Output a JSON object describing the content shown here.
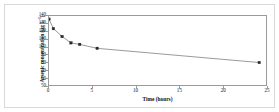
{
  "chart_data": {
    "type": "line",
    "title": "",
    "subtitle": "",
    "xlabel": "Time (hours)",
    "ylabel_main": "Arsenic concentration (µg L",
    "ylabel_sup": "-1",
    "ylabel_close": ")",
    "ylabel_full": "Arsenic concentration (µg L-1)",
    "xlim": [
      0,
      25
    ],
    "ylim": [
      50,
      140
    ],
    "xticks": [
      0,
      5,
      10,
      15,
      20,
      25
    ],
    "xtick_labels": [
      "0",
      "5",
      "10",
      "15",
      "20",
      "25"
    ],
    "yticks": [
      50,
      60,
      70,
      80,
      90,
      100,
      110,
      120,
      130,
      140
    ],
    "ytick_labels": [
      "50",
      "60",
      "70",
      "80",
      "90",
      "100",
      "110",
      "120",
      "130",
      "140"
    ],
    "grid": false,
    "legend": null,
    "legend_position": "none",
    "marker_style": "filled-square",
    "line_color": "#6e6e6e",
    "marker_color": "#2b2b2b",
    "axis_color": "#9a9a9a",
    "frame_color": "#d8d8d8",
    "background_color": "#ffffff",
    "series": [
      {
        "name": "Arsenic concentration",
        "x": [
          0,
          0.5,
          1.5,
          2.5,
          3.5,
          5.5,
          24
        ],
        "values": [
          136,
          124,
          114,
          106,
          104,
          99,
          81
        ]
      }
    ]
  }
}
